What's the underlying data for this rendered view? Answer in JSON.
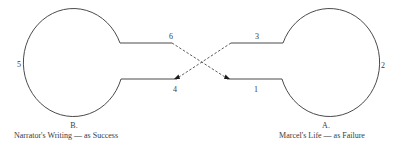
{
  "diagram": {
    "left_loop": {
      "letter": "B.",
      "caption": "Narrator's Writing — as Success",
      "side_label": "5",
      "upper_label": "6",
      "lower_label": "4"
    },
    "right_loop": {
      "letter": "A.",
      "caption": "Marcel's Life — as Failure",
      "side_label": "2",
      "upper_label": "3",
      "lower_label": "1"
    },
    "colors": {
      "line": "#4a4a4a",
      "arrow": "#1a1a1a",
      "text": "#3a3a3a",
      "background": "#ffffff"
    }
  }
}
